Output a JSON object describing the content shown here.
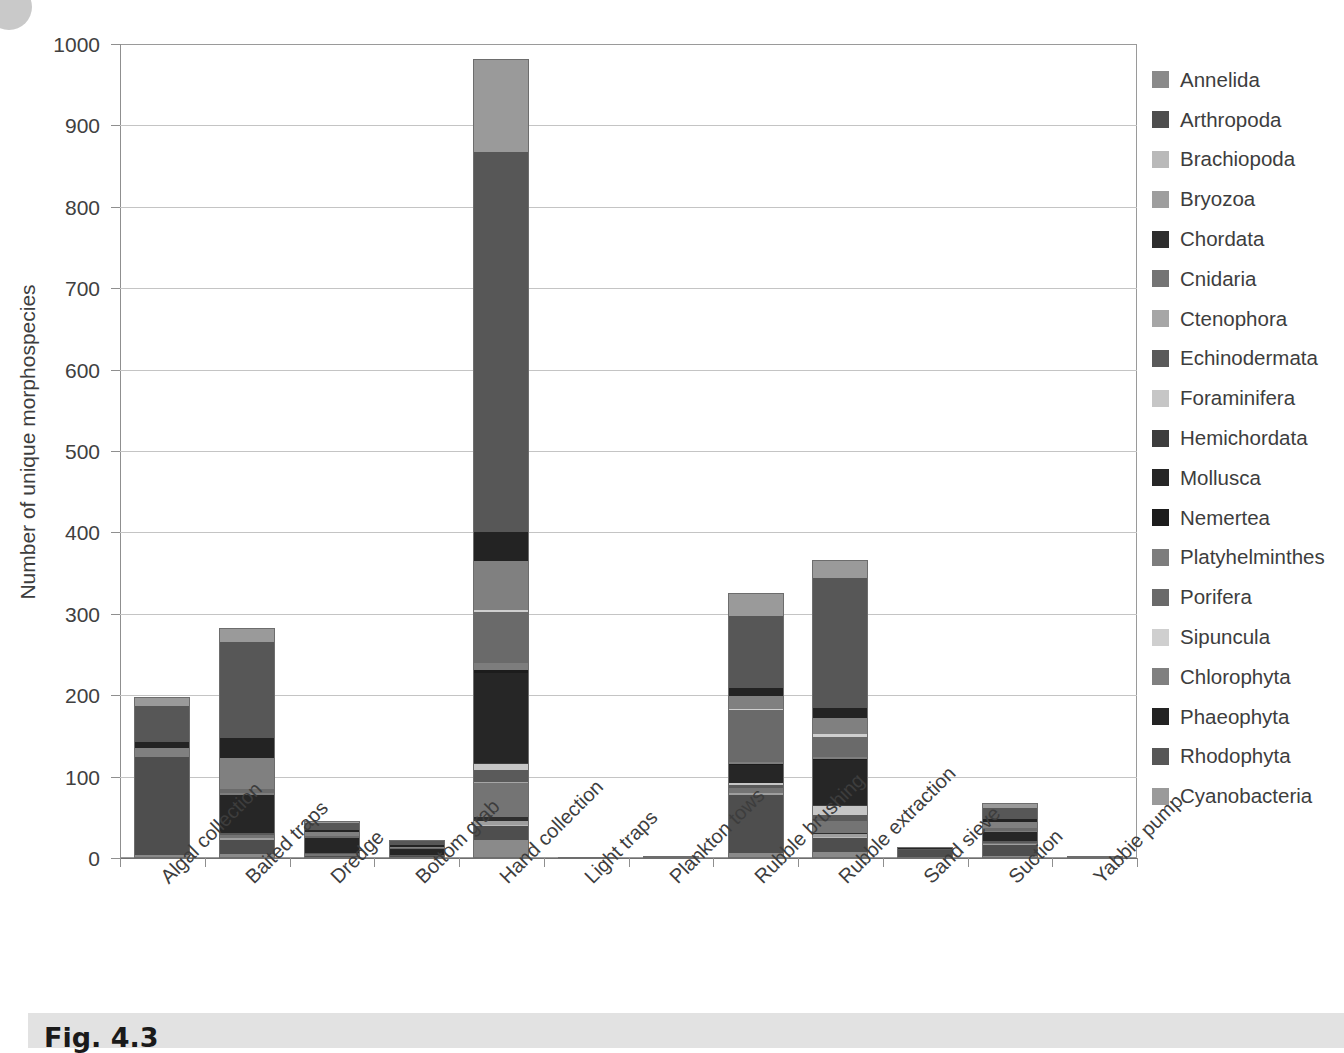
{
  "figure": {
    "caption": "Fig. 4.3",
    "corner_marker": "circle-marker"
  },
  "chart_data": {
    "type": "bar",
    "stacked": true,
    "title": "",
    "xlabel": "",
    "ylabel": "Number of unique morphospecies",
    "ylim": [
      0,
      1000
    ],
    "ytick_step": 100,
    "yticks": [
      0,
      100,
      200,
      300,
      400,
      500,
      600,
      700,
      800,
      900,
      1000
    ],
    "ytick_labels": [
      "0",
      "100",
      "200",
      "300",
      "400",
      "500",
      "600",
      "700",
      "800",
      "900",
      "1000"
    ],
    "grid": true,
    "legend_position": "right",
    "categories": [
      "Algal collection",
      "Baited traps",
      "Dredge",
      "Bottom grab",
      "Hand collection",
      "Light traps",
      "Plankton tows",
      "Rubble brushing",
      "Rubble extraction",
      "Sand sieve",
      "Suction",
      "Yabbie pump"
    ],
    "totals": [
      198,
      283,
      46,
      22,
      982,
      1,
      3,
      325,
      366,
      14,
      67,
      2
    ],
    "series": [
      {
        "name": "Annelida",
        "color": "#8a8a8a",
        "values": [
          4,
          5,
          1,
          1,
          22,
          0,
          0,
          6,
          7,
          1,
          3,
          0
        ]
      },
      {
        "name": "Arthropoda",
        "color": "#4e4e4e",
        "values": [
          120,
          17,
          2,
          1,
          17,
          0,
          1,
          72,
          18,
          9,
          13,
          1
        ]
      },
      {
        "name": "Brachiopoda",
        "color": "#b9b9b9",
        "values": [
          0,
          0,
          0,
          0,
          2,
          0,
          0,
          0,
          1,
          0,
          0,
          0
        ]
      },
      {
        "name": "Bryozoa",
        "color": "#9e9e9e",
        "values": [
          0,
          2,
          0,
          0,
          4,
          0,
          0,
          2,
          3,
          0,
          1,
          0
        ]
      },
      {
        "name": "Chordata",
        "color": "#2e2e2e",
        "values": [
          0,
          0,
          0,
          0,
          5,
          0,
          0,
          0,
          2,
          0,
          0,
          0
        ]
      },
      {
        "name": "Cnidaria",
        "color": "#747474",
        "values": [
          0,
          4,
          2,
          1,
          42,
          0,
          0,
          6,
          14,
          0,
          2,
          0
        ]
      },
      {
        "name": "Ctenophora",
        "color": "#a6a6a6",
        "values": [
          0,
          0,
          0,
          0,
          2,
          0,
          1,
          0,
          0,
          0,
          0,
          0
        ]
      },
      {
        "name": "Echinodermata",
        "color": "#5a5a5a",
        "values": [
          0,
          3,
          1,
          1,
          14,
          0,
          0,
          4,
          8,
          1,
          2,
          0
        ]
      },
      {
        "name": "Foraminifera",
        "color": "#c6c6c6",
        "values": [
          0,
          0,
          0,
          0,
          8,
          0,
          0,
          2,
          11,
          0,
          0,
          0
        ]
      },
      {
        "name": "Hemichordata",
        "color": "#3d3d3d",
        "values": [
          0,
          0,
          0,
          0,
          1,
          0,
          0,
          0,
          1,
          0,
          0,
          0
        ]
      },
      {
        "name": "Mollusca",
        "color": "#262626",
        "values": [
          0,
          47,
          19,
          7,
          110,
          0,
          0,
          22,
          56,
          1,
          11,
          0
        ]
      },
      {
        "name": "Nemertea",
        "color": "#1c1c1c",
        "values": [
          0,
          0,
          0,
          0,
          4,
          0,
          0,
          1,
          1,
          0,
          0,
          0
        ]
      },
      {
        "name": "Platyhelminthes",
        "color": "#7d7d7d",
        "values": [
          0,
          2,
          0,
          0,
          9,
          0,
          0,
          3,
          2,
          0,
          1,
          0
        ]
      },
      {
        "name": "Porifera",
        "color": "#6a6a6a",
        "values": [
          0,
          5,
          2,
          1,
          62,
          0,
          0,
          64,
          25,
          0,
          4,
          0
        ]
      },
      {
        "name": "Sipuncula",
        "color": "#cfcfcf",
        "values": [
          0,
          0,
          0,
          0,
          3,
          0,
          0,
          1,
          4,
          0,
          0,
          0
        ]
      },
      {
        "name": "Chlorophyta",
        "color": "#808080",
        "values": [
          11,
          38,
          5,
          2,
          60,
          0,
          0,
          16,
          19,
          1,
          7,
          1
        ]
      },
      {
        "name": "Phaeophyta",
        "color": "#232323",
        "values": [
          8,
          24,
          3,
          2,
          36,
          0,
          0,
          10,
          12,
          0,
          4,
          0
        ]
      },
      {
        "name": "Rhodophyta",
        "color": "#575757",
        "values": [
          44,
          119,
          8,
          5,
          466,
          1,
          1,
          88,
          160,
          1,
          14,
          0
        ]
      },
      {
        "name": "Cyanobacteria",
        "color": "#9a9a9a",
        "values": [
          11,
          17,
          3,
          1,
          115,
          0,
          0,
          28,
          22,
          0,
          5,
          0
        ]
      }
    ]
  }
}
